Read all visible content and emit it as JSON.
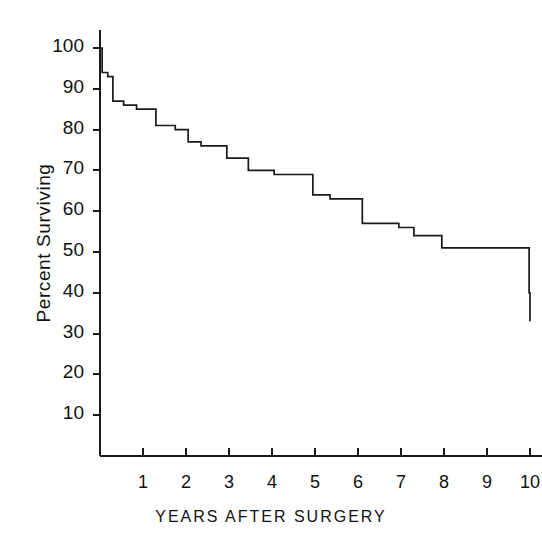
{
  "chart_data": {
    "type": "line",
    "subtype": "kaplan-meier-step",
    "title": "",
    "xlabel": "YEARS AFTER SURGERY",
    "ylabel": "Percent Surviving",
    "xlim": [
      0,
      10.4
    ],
    "ylim": [
      0,
      104
    ],
    "grid": false,
    "legend": null,
    "xticks": [
      1,
      2,
      3,
      4,
      5,
      6,
      7,
      8,
      9,
      10
    ],
    "xtick_labels": [
      "1",
      "2",
      "3",
      "4",
      "5",
      "6",
      "7",
      "8",
      "9",
      "10"
    ],
    "yticks": [
      10,
      20,
      30,
      40,
      50,
      60,
      70,
      80,
      90,
      100
    ],
    "ytick_labels": [
      "10",
      "20",
      "30",
      "40",
      "50",
      "60",
      "70",
      "80",
      "90",
      "100"
    ],
    "series": [
      {
        "name": "Percent Surviving",
        "step": "post",
        "x": [
          0.0,
          0.05,
          0.18,
          0.3,
          0.55,
          0.85,
          1.3,
          1.75,
          2.05,
          2.35,
          2.95,
          3.45,
          4.05,
          4.95,
          5.35,
          6.1,
          6.95,
          7.3,
          7.95,
          9.98,
          10.0
        ],
        "y": [
          100,
          94,
          93,
          87,
          86,
          85,
          81,
          80,
          77,
          76,
          73,
          70,
          69,
          64,
          63,
          57,
          56,
          54,
          51,
          40,
          33
        ]
      }
    ],
    "drops": [
      {
        "year": 0.05,
        "from": 100,
        "to": 94
      },
      {
        "year": 0.18,
        "from": 94,
        "to": 93
      },
      {
        "year": 0.3,
        "from": 93,
        "to": 87
      },
      {
        "year": 0.55,
        "from": 87,
        "to": 86
      },
      {
        "year": 0.85,
        "from": 86,
        "to": 85
      },
      {
        "year": 1.3,
        "from": 85,
        "to": 81
      },
      {
        "year": 1.75,
        "from": 81,
        "to": 80
      },
      {
        "year": 2.05,
        "from": 80,
        "to": 77
      },
      {
        "year": 2.35,
        "from": 77,
        "to": 76
      },
      {
        "year": 2.95,
        "from": 76,
        "to": 73
      },
      {
        "year": 3.45,
        "from": 73,
        "to": 70
      },
      {
        "year": 4.05,
        "from": 70,
        "to": 69
      },
      {
        "year": 4.95,
        "from": 69,
        "to": 64
      },
      {
        "year": 5.35,
        "from": 64,
        "to": 63
      },
      {
        "year": 6.1,
        "from": 63,
        "to": 57
      },
      {
        "year": 6.95,
        "from": 57,
        "to": 56
      },
      {
        "year": 7.3,
        "from": 56,
        "to": 54
      },
      {
        "year": 7.95,
        "from": 54,
        "to": 51
      },
      {
        "year": 9.98,
        "from": 51,
        "to": 40
      },
      {
        "year": 10.0,
        "from": 40,
        "to": 33
      }
    ],
    "colors": {
      "line": "#1a1a1a",
      "axis": "#1a1a1a",
      "background": "#ffffff"
    }
  }
}
